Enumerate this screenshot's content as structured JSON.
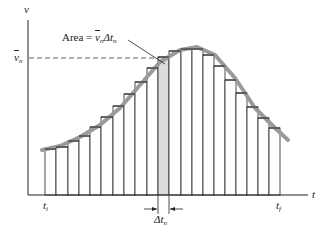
{
  "figure": {
    "y_axis_label": "v",
    "x_axis_label": "t",
    "vbar_label_main": "v",
    "vbar_label_sub": "n",
    "area_label_prefix": "Area = ",
    "area_v": "v",
    "area_v_sub": "n",
    "area_delta": "Δt",
    "area_delta_sub": "n",
    "ti_main": "t",
    "ti_sub": "i",
    "tf_main": "t",
    "tf_sub": "f",
    "dt_main": "Δt",
    "dt_sub": "n",
    "colors": {
      "ink": "#222222",
      "curve": "#9a9a9a",
      "shaded_bar": "#dcdcdc"
    }
  },
  "chart_data": {
    "type": "bar",
    "title": "",
    "xlabel": "t",
    "ylabel": "v",
    "bar_x_px": [
      45,
      56,
      68,
      79,
      90,
      101,
      113,
      124,
      135,
      147,
      158,
      169,
      181,
      192,
      203,
      214,
      225,
      236,
      247,
      258,
      269,
      280
    ],
    "bar_top_px": [
      149,
      147,
      141,
      136,
      127,
      117,
      106,
      94,
      82,
      68,
      57,
      51,
      49,
      49,
      55,
      66,
      80,
      93,
      107,
      118,
      128
    ],
    "highlighted_bar_index": 10,
    "baseline_px": 195,
    "curve_px": [
      [
        42,
        150
      ],
      [
        60,
        146
      ],
      [
        80,
        137
      ],
      [
        100,
        125
      ],
      [
        120,
        108
      ],
      [
        140,
        85
      ],
      [
        160,
        62
      ],
      [
        180,
        50
      ],
      [
        197,
        47
      ],
      [
        215,
        55
      ],
      [
        235,
        78
      ],
      [
        255,
        108
      ],
      [
        275,
        128
      ],
      [
        288,
        140
      ]
    ],
    "annotations": [
      "Area = v̄_n Δt_n",
      "v̄_n",
      "t_i",
      "t_f",
      "Δt_n"
    ],
    "grid": false
  }
}
